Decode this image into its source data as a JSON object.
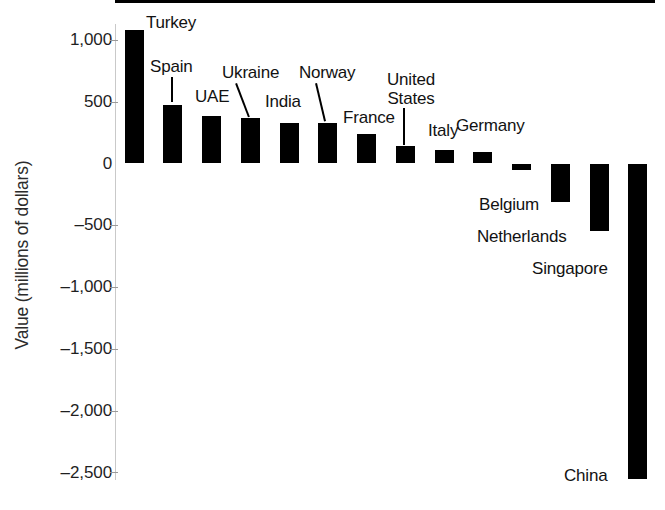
{
  "chart_data": {
    "type": "bar",
    "title": "",
    "xlabel": "",
    "ylabel": "Value (millions of dollars)",
    "ylim": [
      -2500,
      1000
    ],
    "ytick_values": [
      1000,
      500,
      0,
      -500,
      -1000,
      -1500,
      -2000,
      -2500
    ],
    "ytick_labels": [
      "1,000",
      "500",
      "0",
      "–500",
      "–1,000",
      "–1,500",
      "–2,000",
      "–2,500"
    ],
    "grid": false,
    "legend": "none",
    "bar_color": "#000000",
    "categories": [
      "Turkey",
      "Spain",
      "UAE",
      "Ukraine",
      "India",
      "Norway",
      "France",
      "United States",
      "Italy",
      "Germany",
      "Belgium",
      "Netherlands",
      "Singapore",
      "China"
    ],
    "values": [
      1080,
      470,
      385,
      365,
      330,
      325,
      240,
      140,
      110,
      95,
      -50,
      -310,
      -550,
      -2550
    ]
  },
  "axis": {
    "y_title": "Value (millions of dollars)",
    "ticks": [
      {
        "label": "1,000",
        "value": 1000
      },
      {
        "label": "500",
        "value": 500
      },
      {
        "label": "0",
        "value": 0
      },
      {
        "label": "–500",
        "value": -500
      },
      {
        "label": "–1,000",
        "value": -1000
      },
      {
        "label": "–1,500",
        "value": -1500
      },
      {
        "label": "–2,000",
        "value": -2000
      },
      {
        "label": "–2,500",
        "value": -2500
      }
    ]
  },
  "bars": [
    {
      "name": "Turkey",
      "value": 1080,
      "label": "Turkey"
    },
    {
      "name": "Spain",
      "value": 470,
      "label": "Spain"
    },
    {
      "name": "UAE",
      "value": 385,
      "label": "UAE"
    },
    {
      "name": "Ukraine",
      "value": 365,
      "label": "Ukraine"
    },
    {
      "name": "India",
      "value": 330,
      "label": "India"
    },
    {
      "name": "Norway",
      "value": 325,
      "label": "Norway"
    },
    {
      "name": "France",
      "value": 240,
      "label": "France"
    },
    {
      "name": "United States",
      "value": 140,
      "label": "United States",
      "label_line1": "United",
      "label_line2": "States"
    },
    {
      "name": "Italy",
      "value": 110,
      "label": "Italy"
    },
    {
      "name": "Germany",
      "value": 95,
      "label": "Germany"
    },
    {
      "name": "Belgium",
      "value": -50,
      "label": "Belgium"
    },
    {
      "name": "Netherlands",
      "value": -310,
      "label": "Netherlands"
    },
    {
      "name": "Singapore",
      "value": -550,
      "label": "Singapore"
    },
    {
      "name": "China",
      "value": -2550,
      "label": "China"
    }
  ]
}
